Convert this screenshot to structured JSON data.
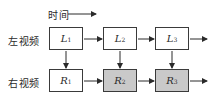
{
  "time_axis": {
    "label": "时间"
  },
  "rows": [
    {
      "label": "左视频",
      "frames": [
        {
          "symbol": "L",
          "index": "1",
          "shaded": false
        },
        {
          "symbol": "L",
          "index": "2",
          "shaded": false
        },
        {
          "symbol": "L",
          "index": "3",
          "shaded": false
        }
      ]
    },
    {
      "label": "右视频",
      "frames": [
        {
          "symbol": "R",
          "index": "1",
          "shaded": false
        },
        {
          "symbol": "R",
          "index": "2",
          "shaded": true
        },
        {
          "symbol": "R",
          "index": "3",
          "shaded": true
        }
      ]
    }
  ],
  "colors": {
    "shaded_fill": "#c9c9c9",
    "stroke": "#3a3a3a"
  }
}
